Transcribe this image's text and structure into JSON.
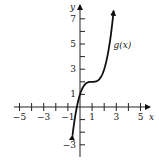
{
  "chart_data": {
    "type": "line",
    "title": "",
    "xlabel": "x",
    "ylabel": "y",
    "xlim": [
      -5.5,
      5.5
    ],
    "ylim": [
      -4,
      8
    ],
    "x_tick_labels": [
      "−5",
      "−3",
      "−1",
      "1",
      "3",
      "5"
    ],
    "x_tick_values": [
      -5,
      -3,
      -1,
      1,
      3,
      5
    ],
    "y_tick_labels": [
      "7",
      "5",
      "3",
      "1",
      "−3"
    ],
    "y_tick_values": [
      7,
      5,
      3,
      1,
      -3
    ],
    "grid": false,
    "series": [
      {
        "name": "g(x)",
        "formula": "(x-1)^3 + 2",
        "x": [
          -0.6,
          -0.4,
          -0.2,
          0,
          0.2,
          0.4,
          0.6,
          0.8,
          1.0,
          1.2,
          1.4,
          1.6,
          1.8,
          2.0,
          2.2,
          2.4,
          2.6,
          2.8,
          3.0
        ],
        "values": [
          -2.1,
          -0.74,
          0.27,
          1,
          1.49,
          1.78,
          1.94,
          1.99,
          2,
          2.01,
          2.06,
          2.22,
          2.51,
          3,
          3.73,
          4.74,
          6.1,
          7.83,
          10
        ],
        "arrows": "both ends"
      }
    ],
    "annotations": [
      {
        "text": "g(x)",
        "x": 2.6,
        "y": 4.9
      }
    ]
  },
  "labels": {
    "x_axis": "x",
    "y_axis": "y",
    "curve": "g(x)"
  }
}
